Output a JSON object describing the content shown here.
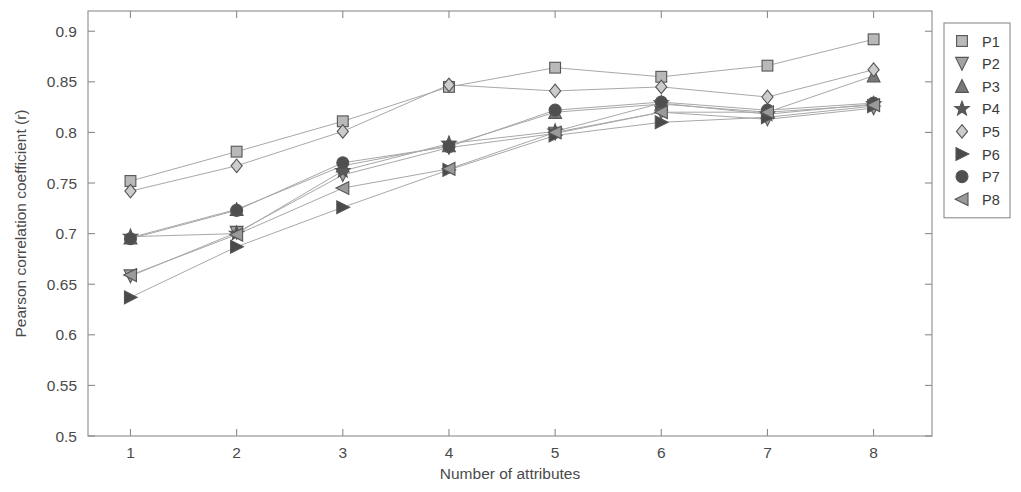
{
  "chart_data": {
    "type": "line",
    "title": "",
    "xlabel": "Number of attributes",
    "ylabel": "Pearson correlation coefficient (r)",
    "x": [
      1,
      2,
      3,
      4,
      5,
      6,
      7,
      8
    ],
    "xlim": [
      0.6,
      8.55
    ],
    "ylim": [
      0.5,
      0.92
    ],
    "ytick_labels": [
      "0.5",
      "0.55",
      "0.6",
      "0.65",
      "0.7",
      "0.75",
      "0.8",
      "0.85",
      "0.9"
    ],
    "ytick_values": [
      0.5,
      0.55,
      0.6,
      0.65,
      0.7,
      0.75,
      0.8,
      0.85,
      0.9
    ],
    "xtick_labels": [
      "1",
      "2",
      "3",
      "4",
      "5",
      "6",
      "7",
      "8"
    ],
    "grid": false,
    "legend_position": "right-outside",
    "series": [
      {
        "name": "P1",
        "marker": "square",
        "color": "#b9b9b9",
        "values": [
          0.752,
          0.781,
          0.811,
          0.845,
          0.864,
          0.855,
          0.866,
          0.892
        ]
      },
      {
        "name": "P2",
        "marker": "triangle-down",
        "color": "#a3a3a3",
        "values": [
          0.658,
          0.701,
          0.758,
          0.785,
          0.799,
          0.82,
          0.813,
          0.824
        ]
      },
      {
        "name": "P3",
        "marker": "triangle-up",
        "color": "#787878",
        "values": [
          0.696,
          0.724,
          0.767,
          0.787,
          0.82,
          0.828,
          0.82,
          0.856
        ]
      },
      {
        "name": "P4",
        "marker": "star",
        "color": "#5a5a5a",
        "values": [
          0.697,
          0.7,
          0.762,
          0.789,
          0.801,
          0.829,
          0.818,
          0.828
        ]
      },
      {
        "name": "P5",
        "marker": "diamond",
        "color": "#cccccc",
        "values": [
          0.742,
          0.767,
          0.801,
          0.847,
          0.841,
          0.845,
          0.835,
          0.862
        ]
      },
      {
        "name": "P6",
        "marker": "triangle-right",
        "color": "#4a4a4a",
        "values": [
          0.637,
          0.687,
          0.726,
          0.763,
          0.797,
          0.81,
          0.815,
          0.826
        ]
      },
      {
        "name": "P7",
        "marker": "circle",
        "color": "#4f4f4f",
        "values": [
          0.695,
          0.723,
          0.77,
          0.786,
          0.822,
          0.83,
          0.822,
          0.829
        ]
      },
      {
        "name": "P8",
        "marker": "triangle-left",
        "color": "#9a9a9a",
        "values": [
          0.659,
          0.699,
          0.745,
          0.764,
          0.8,
          0.82,
          0.82,
          0.827
        ]
      }
    ]
  },
  "legend": {
    "items": [
      {
        "label": "P1"
      },
      {
        "label": "P2"
      },
      {
        "label": "P3"
      },
      {
        "label": "P4"
      },
      {
        "label": "P5"
      },
      {
        "label": "P6"
      },
      {
        "label": "P7"
      },
      {
        "label": "P8"
      }
    ]
  }
}
